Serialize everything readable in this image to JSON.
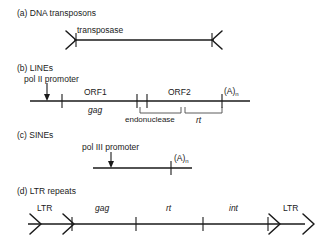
{
  "figure": {
    "background_color": "#ffffff",
    "line_color": "#1a1a1a"
  },
  "panels": [
    {
      "id": "a",
      "heading": "(a) DNA transposons",
      "labels": {
        "transposase": "transposase"
      },
      "features": [
        "inverted repeat left",
        "transposase gene",
        "inverted repeat right"
      ]
    },
    {
      "id": "b",
      "heading": "(b) LINEs",
      "labels": {
        "promoter": "pol II promoter",
        "orf1": "ORF1",
        "orf2": "ORF2",
        "gag": "gag",
        "endonuclease": "endonuclease",
        "rt": "rt",
        "polyA_main": "(A)",
        "polyA_sub": "n"
      }
    },
    {
      "id": "c",
      "heading": "(c) SINEs",
      "labels": {
        "promoter": "pol III promoter",
        "polyA_main": "(A)",
        "polyA_sub": "n"
      }
    },
    {
      "id": "d",
      "heading": "(d) LTR repeats",
      "labels": {
        "ltr_left": "LTR",
        "gag": "gag",
        "rt": "rt",
        "int": "int",
        "ltr_right": "LTR"
      }
    }
  ]
}
